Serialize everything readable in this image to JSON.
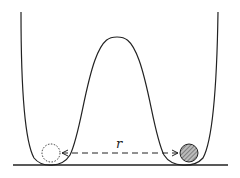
{
  "diagram": {
    "type": "double-well potential",
    "distance_label": "r",
    "left_particle": "dashed-empty-circle",
    "right_particle": "hatched-filled-circle",
    "colors": {
      "line": "#222222",
      "hatch": "#555555",
      "background": "#ffffff"
    }
  }
}
